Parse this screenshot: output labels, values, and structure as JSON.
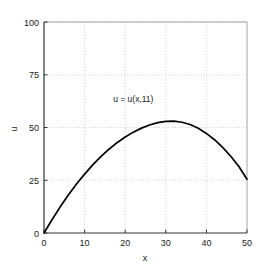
{
  "chart_data": {
    "type": "line",
    "title": "",
    "xlabel": "x",
    "ylabel": "u",
    "xlim": [
      0,
      50
    ],
    "ylim": [
      0,
      100
    ],
    "xticks": [
      "0",
      "10",
      "20",
      "30",
      "40",
      "50"
    ],
    "xtick_values": [
      0,
      10,
      20,
      30,
      40,
      50
    ],
    "yticks": [
      "0",
      "25",
      "50",
      "75",
      "100"
    ],
    "ytick_values": [
      0,
      25,
      50,
      75,
      100
    ],
    "grid": true,
    "grid_style": "dotted",
    "legend": null,
    "annotations": [
      {
        "text": "u = u(x,11)",
        "x": 22,
        "y": 62
      }
    ],
    "series": [
      {
        "name": "u = u(x,11)",
        "color": "#000000",
        "x": [
          0,
          2,
          4,
          6,
          8,
          10,
          12,
          14,
          16,
          18,
          20,
          22,
          24,
          26,
          28,
          30,
          32,
          34,
          36,
          38,
          40,
          42,
          44,
          46,
          48,
          50
        ],
        "values": [
          0,
          6.4,
          12.4,
          18.0,
          23.2,
          27.9,
          32.3,
          36.2,
          39.7,
          42.8,
          45.5,
          47.8,
          49.7,
          51.2,
          52.3,
          52.9,
          53.0,
          52.5,
          51.4,
          49.6,
          47.2,
          44.2,
          40.6,
          36.4,
          31.5,
          25.5
        ]
      }
    ]
  },
  "axes": {
    "x_title": "x",
    "y_title": "u"
  }
}
